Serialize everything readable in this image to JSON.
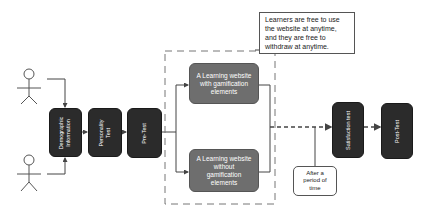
{
  "diagram": {
    "actors": [
      {
        "id": "actor-1"
      },
      {
        "id": "actor-2"
      }
    ],
    "steps": {
      "demographic": "Demographic Information",
      "personality": "Personality Test",
      "pretest": "Pre-Test",
      "satisfaction": "Satisfaction test",
      "posttest": "Post-Test"
    },
    "groups": {
      "with_gamification": "A Learning website with gamification elements",
      "without_gamification": "A Learning website without gamification elements"
    },
    "note": "Learners are free to use the website at anytime, and they are free to withdraw at anytime.",
    "callout": "After a period of time",
    "colors": {
      "dark_box": "#2b2b2b",
      "gray_box": "#6e6e6e",
      "line": "#444444"
    }
  }
}
